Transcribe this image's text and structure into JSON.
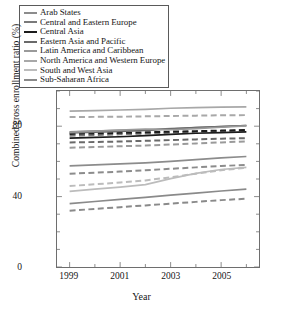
{
  "chart_data": {
    "type": "line",
    "title": "",
    "xlabel": "Year",
    "ylabel": "Combined gross enrollment ratio (%)",
    "xlim": [
      1998.5,
      2006.5
    ],
    "ylim": [
      0,
      100
    ],
    "xticks": [
      1999,
      2001,
      2003,
      2005
    ],
    "xticks_minor": [
      2000,
      2002,
      2004,
      2006
    ],
    "yticks": [
      0,
      40,
      80
    ],
    "yticks_minor": [
      10,
      20,
      30,
      50,
      60,
      70,
      90,
      100
    ],
    "grid": false,
    "legend_position": "above-plot",
    "x": [
      1999,
      2000,
      2001,
      2002,
      2003,
      2004,
      2005,
      2006
    ],
    "series": [
      {
        "name": "Arab States",
        "color": "#8c8c8c",
        "values_solid": [
          57.5,
          58.0,
          58.6,
          59.2,
          60.0,
          61.0,
          62.0,
          62.8
        ],
        "values_dashed": [
          53.0,
          53.6,
          54.2,
          55.0,
          55.8,
          56.6,
          57.4,
          58.0
        ]
      },
      {
        "name": "Central and Eastern Europe",
        "color": "#7a7a7a",
        "values_solid": [
          76.8,
          77.2,
          77.6,
          78.0,
          78.6,
          79.2,
          79.8,
          80.4
        ],
        "values_dashed": [
          74.6,
          75.0,
          75.4,
          75.8,
          76.3,
          76.8,
          77.3,
          77.8
        ]
      },
      {
        "name": "Central Asia",
        "color": "#1c1c1c",
        "values_solid": [
          73.2,
          73.6,
          74.0,
          74.6,
          75.4,
          76.0,
          76.4,
          76.8
        ],
        "values_dashed": [
          75.6,
          75.9,
          76.2,
          76.5,
          76.9,
          77.2,
          77.5,
          77.8
        ]
      },
      {
        "name": "Eastern Asia and Pacific",
        "color": "#6a6a6a",
        "values_solid": [
          76.2,
          76.6,
          77.0,
          77.6,
          78.4,
          79.2,
          79.8,
          80.4
        ],
        "values_dashed": [
          70.8,
          71.0,
          71.3,
          71.7,
          72.1,
          72.5,
          72.9,
          73.2
        ]
      },
      {
        "name": "Latin America and Caribbean",
        "color": "#9a9a9a",
        "values_solid": [
          76.6,
          77.2,
          77.8,
          78.4,
          78.0,
          78.6,
          79.4,
          80.2
        ],
        "values_dashed": [
          67.8,
          68.2,
          68.6,
          69.0,
          69.6,
          70.2,
          70.8,
          71.4
        ]
      },
      {
        "name": "North America and Western Europe",
        "color": "#a8a8a8",
        "values_solid": [
          88.6,
          88.9,
          89.2,
          89.6,
          90.2,
          90.6,
          90.8,
          91.0
        ],
        "values_dashed": [
          85.2,
          85.3,
          85.4,
          85.6,
          85.8,
          86.0,
          86.2,
          86.3
        ]
      },
      {
        "name": "South and West Asia",
        "color": "#bcbcbc",
        "values_solid": [
          43.0,
          44.2,
          45.4,
          46.8,
          50.2,
          53.2,
          55.4,
          56.6
        ],
        "values_dashed": [
          46.0,
          47.0,
          48.0,
          49.2,
          51.0,
          53.0,
          55.0,
          56.4
        ]
      },
      {
        "name": "Sub-Saharan Africa",
        "color": "#8a8a8a",
        "values_solid": [
          36.0,
          37.2,
          38.4,
          39.6,
          40.8,
          42.0,
          43.2,
          44.2
        ],
        "values_dashed": [
          32.0,
          33.0,
          34.0,
          35.0,
          36.0,
          37.0,
          38.0,
          38.8
        ]
      }
    ]
  },
  "legend": {
    "items": [
      {
        "label": "Arab States",
        "color": "#8c8c8c"
      },
      {
        "label": "Central and Eastern Europe",
        "color": "#7a7a7a"
      },
      {
        "label": "Central Asia",
        "color": "#1c1c1c"
      },
      {
        "label": "Eastern Asia and Pacific",
        "color": "#6a6a6a"
      },
      {
        "label": "Latin America and Caribbean",
        "color": "#9a9a9a"
      },
      {
        "label": "North America and Western Europe",
        "color": "#a8a8a8"
      },
      {
        "label": "South and West Asia",
        "color": "#bcbcbc"
      },
      {
        "label": "Sub-Saharan Africa",
        "color": "#8a8a8a"
      }
    ]
  },
  "axes": {
    "xlabel": "Year",
    "ylabel": "Combined gross enrollment ratio (%)",
    "xtick_labels": [
      "1999",
      "2001",
      "2003",
      "2005"
    ],
    "ytick_labels": [
      "0",
      "40",
      "80"
    ]
  }
}
